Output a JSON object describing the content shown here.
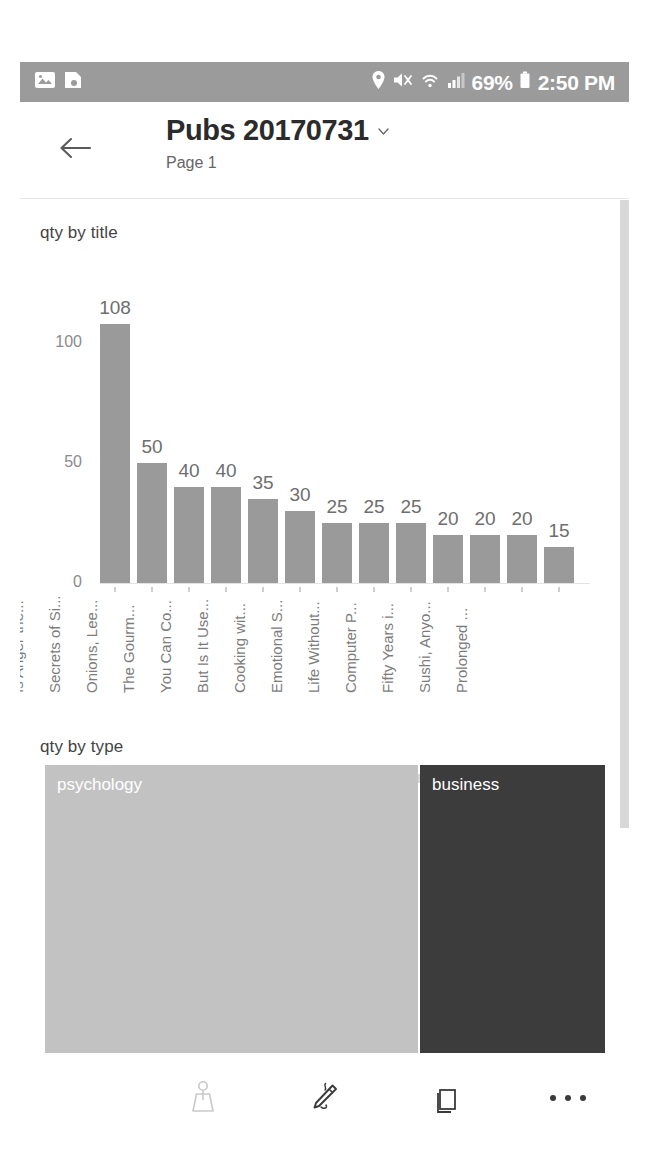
{
  "status_bar": {
    "background": "#9b9b9b",
    "left_icons": [
      "image-icon",
      "screenshot-icon"
    ],
    "right_icons": [
      "location-pin-icon",
      "volume-mute-icon",
      "wifi-icon",
      "cellular-signal-icon",
      "battery-icon"
    ],
    "battery_percent": "69%",
    "clock": "2:50 PM"
  },
  "header": {
    "back_icon": "back-arrow-icon",
    "title": "Pubs 20170731",
    "title_chevron": "chevron-down-icon",
    "page_label": "Page 1"
  },
  "visuals": {
    "bar_title": "qty by title",
    "treemap_title": "qty by type"
  },
  "chart_data": [
    {
      "type": "bar",
      "title": "qty by title",
      "xlabel": "",
      "ylabel": "",
      "ylim": [
        0,
        120
      ],
      "yticks": [
        "0",
        "50",
        "100"
      ],
      "ytick_values": [
        0,
        50,
        100
      ],
      "grid": false,
      "legend": "none",
      "bar_color": "#9a9a9a",
      "categories": [
        "Is Anger the...",
        "Secrets of Si...",
        "Onions, Lee...",
        "The Gourm...",
        "You Can Co...",
        "But Is It Use...",
        "Cooking wit...",
        "Emotional S...",
        "Life Without...",
        "Computer P...",
        "Fifty Years i...",
        "Sushi, Anyo...",
        "Prolonged ..."
      ],
      "values": [
        108,
        50,
        40,
        40,
        35,
        30,
        25,
        25,
        25,
        20,
        20,
        20,
        15
      ],
      "data_labels": [
        "108",
        "50",
        "40",
        "40",
        "35",
        "30",
        "25",
        "25",
        "25",
        "20",
        "20",
        "20",
        "15"
      ]
    },
    {
      "type": "treemap",
      "title": "qty by type",
      "categories": [
        "psychology",
        "business"
      ],
      "values": [
        357,
        177
      ],
      "colors": [
        "#c2c2c2",
        "#3c3c3c"
      ],
      "label_color": "#ffffff"
    }
  ],
  "scrollbars": {
    "horizontal_thumb_color": "#d8d8d8",
    "vertical_thumb_color": "#d8d8d8"
  },
  "bottom_toolbar": {
    "items": [
      {
        "name": "filter-icon",
        "label": "Filters"
      },
      {
        "name": "annotate-pencil-icon",
        "label": "Annotate"
      },
      {
        "name": "pages-icon",
        "label": "Pages"
      },
      {
        "name": "more-icon",
        "label": "More"
      }
    ]
  }
}
